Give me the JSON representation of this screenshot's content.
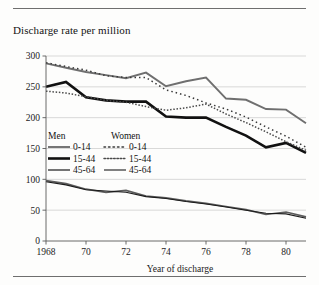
{
  "chart_data": {
    "type": "line",
    "title": "Discharge rate per million",
    "xlabel": "Year of discharge",
    "ylabel": "",
    "xlim": [
      1968,
      1981
    ],
    "ylim": [
      0,
      300
    ],
    "grid": true,
    "legend_position": "inside-left",
    "x": [
      1968,
      1969,
      1970,
      1971,
      1972,
      1973,
      1974,
      1975,
      1976,
      1977,
      1978,
      1979,
      1980,
      1981
    ],
    "xtick_labels": [
      "1968",
      "70",
      "72",
      "74",
      "76",
      "78",
      "80"
    ],
    "xtick_values": [
      1968,
      1970,
      1972,
      1974,
      1976,
      1978,
      1980
    ],
    "ytick_labels": [
      "0",
      "50",
      "100",
      "150",
      "200",
      "250",
      "300"
    ],
    "ytick_values": [
      0,
      50,
      100,
      150,
      200,
      250,
      300
    ],
    "series": [
      {
        "name": "Men 0-14",
        "group": "Men",
        "age": "0-14",
        "style": "solid",
        "color": "#6f6f6f",
        "width": 1.9,
        "values": [
          288,
          281,
          274,
          269,
          264,
          273,
          251,
          259,
          265,
          231,
          229,
          214,
          213,
          191
        ]
      },
      {
        "name": "Men 15-44",
        "group": "Men",
        "age": "15-44",
        "style": "solid",
        "color": "#111111",
        "width": 2.6,
        "values": [
          250,
          258,
          233,
          228,
          226,
          226,
          202,
          200,
          200,
          185,
          171,
          152,
          159,
          143
        ]
      },
      {
        "name": "Men 45-64",
        "group": "Men",
        "age": "45-64",
        "style": "solid",
        "color": "#5c5c5c",
        "width": 1.7,
        "values": [
          98,
          93,
          84,
          79,
          82,
          73,
          70,
          65,
          61,
          56,
          51,
          43,
          47,
          39
        ]
      },
      {
        "name": "Women 0-14",
        "group": "Women",
        "age": "0-14",
        "style": "dotted-sparse",
        "color": "#3a3a3a",
        "width": 1.5,
        "values": [
          289,
          283,
          277,
          268,
          265,
          265,
          245,
          236,
          224,
          214,
          201,
          185,
          170,
          152
        ]
      },
      {
        "name": "Women 15-44",
        "group": "Women",
        "age": "15-44",
        "style": "dotted-dense",
        "color": "#4a4a4a",
        "width": 1.5,
        "values": [
          243,
          240,
          234,
          228,
          225,
          218,
          212,
          216,
          222,
          206,
          192,
          177,
          161,
          147
        ]
      },
      {
        "name": "Women 45-64",
        "group": "Women",
        "age": "45-64",
        "style": "solid",
        "color": "#1b1b1b",
        "width": 1.1,
        "values": [
          96,
          91,
          83,
          81,
          79,
          72,
          69,
          64,
          60,
          55,
          50,
          45,
          44,
          37
        ]
      }
    ]
  },
  "legend": {
    "men_heading": "Men",
    "women_heading": "Women",
    "men_items": [
      "0-14",
      "15-44",
      "45-64"
    ],
    "women_items": [
      "0-14",
      "15-44",
      "45-64"
    ]
  }
}
